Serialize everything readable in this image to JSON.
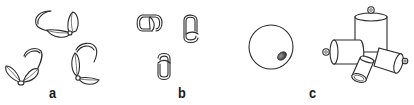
{
  "figure": {
    "panels": [
      {
        "id": "a",
        "label": "a",
        "description": "clamshell bead tips",
        "item_count": 3
      },
      {
        "id": "b",
        "label": "b",
        "description": "crimp covers / calottes",
        "item_count": 3
      },
      {
        "id": "c",
        "label": "c",
        "description": "crimp bead and end caps",
        "item_count": 5
      }
    ],
    "colors": {
      "line": "#2a2a2a",
      "background": "#ffffff",
      "hole_shade": "#555555"
    }
  }
}
